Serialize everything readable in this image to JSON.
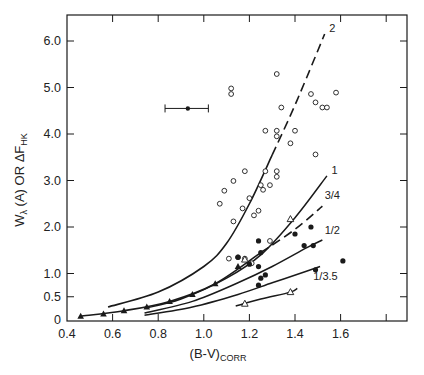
{
  "chart_data": {
    "type": "scatter",
    "title": "",
    "xlabel": "(B-V)CORR",
    "xlabel_main": "(B-V)",
    "xlabel_sub": "CORR",
    "ylabel": "Wλ (A) OR ΔF_HK",
    "ylabel_parts": {
      "w": "W",
      "lambda_sub": "λ",
      "a": " (A)  OR  ",
      "delta_f": "ΔF",
      "hk_sub": "HK"
    },
    "xlim": [
      0.4,
      1.9
    ],
    "ylim": [
      0,
      6.5
    ],
    "grid": false,
    "legend": "none (curves labeled inline)",
    "x_ticks": [
      0.4,
      0.6,
      0.8,
      1.0,
      1.2,
      1.4,
      1.6,
      1.8
    ],
    "x_tick_labels": [
      "0.4",
      "0.6",
      "0.8",
      "1.0",
      "1.2",
      "1.4",
      "1.6",
      ""
    ],
    "y_ticks": [
      0,
      0.5,
      1.0,
      2.0,
      3.0,
      4.0,
      5.0,
      6.0
    ],
    "y_tick_labels": [
      "0",
      "0.5",
      "1.0",
      "2.0",
      "3.0",
      "4.0",
      "5.0",
      "6.0"
    ],
    "series": [
      {
        "name": "open circles",
        "marker": "open-circle",
        "points": [
          [
            1.32,
            5.29
          ],
          [
            1.12,
            4.98
          ],
          [
            1.12,
            4.86
          ],
          [
            1.58,
            4.89
          ],
          [
            1.47,
            4.86
          ],
          [
            1.49,
            4.68
          ],
          [
            1.52,
            4.57
          ],
          [
            1.54,
            4.57
          ],
          [
            1.34,
            4.57
          ],
          [
            1.27,
            4.07
          ],
          [
            1.32,
            4.07
          ],
          [
            1.32,
            3.95
          ],
          [
            1.4,
            4.07
          ],
          [
            1.38,
            3.8
          ],
          [
            1.49,
            3.56
          ],
          [
            1.18,
            3.2
          ],
          [
            1.27,
            3.2
          ],
          [
            1.32,
            3.2
          ],
          [
            1.32,
            3.08
          ],
          [
            1.29,
            2.9
          ],
          [
            1.25,
            2.9
          ],
          [
            1.26,
            2.8
          ],
          [
            1.13,
            2.99
          ],
          [
            1.2,
            2.62
          ],
          [
            1.17,
            2.4
          ],
          [
            1.24,
            2.35
          ],
          [
            1.07,
            2.5
          ],
          [
            1.13,
            2.12
          ],
          [
            1.09,
            2.78
          ],
          [
            1.22,
            2.25
          ],
          [
            1.29,
            1.7
          ],
          [
            1.11,
            1.32
          ],
          [
            1.15,
            1.35
          ],
          [
            1.21,
            1.22
          ],
          [
            1.18,
            1.32
          ]
        ]
      },
      {
        "name": "filled circles",
        "marker": "filled-circle",
        "points": [
          [
            1.24,
            1.7
          ],
          [
            1.4,
            1.85
          ],
          [
            1.47,
            2.0
          ],
          [
            1.44,
            1.6
          ],
          [
            1.48,
            1.6
          ],
          [
            1.61,
            1.27
          ],
          [
            1.49,
            1.08
          ],
          [
            1.15,
            1.35
          ],
          [
            1.25,
            1.45
          ],
          [
            1.24,
            1.15
          ],
          [
            1.25,
            0.9
          ],
          [
            1.27,
            0.97
          ],
          [
            1.24,
            0.75
          ],
          [
            1.2,
            1.2
          ]
        ]
      },
      {
        "name": "filled triangles",
        "marker": "filled-triangle",
        "points": [
          [
            0.46,
            0.08
          ],
          [
            0.56,
            0.13
          ],
          [
            0.65,
            0.2
          ],
          [
            0.75,
            0.28
          ],
          [
            0.85,
            0.4
          ],
          [
            0.95,
            0.55
          ],
          [
            1.05,
            0.78
          ],
          [
            1.15,
            1.15
          ]
        ]
      },
      {
        "name": "open triangles",
        "marker": "open-triangle",
        "points": [
          [
            1.38,
            2.17
          ],
          [
            1.18,
            1.3
          ],
          [
            1.38,
            0.6
          ],
          [
            1.18,
            0.35
          ]
        ]
      },
      {
        "name": "error bar point",
        "marker": "filled-dot-with-xerr",
        "points": [
          [
            0.93,
            4.55
          ]
        ],
        "xerr": [
          0.83,
          1.02
        ]
      }
    ],
    "curves": [
      {
        "label": "2",
        "style": "solid-then-dashed",
        "points": [
          [
            0.58,
            0.28
          ],
          [
            0.8,
            0.6
          ],
          [
            1.0,
            1.15
          ],
          [
            1.1,
            1.65
          ],
          [
            1.2,
            2.5
          ],
          [
            1.3,
            3.55
          ],
          [
            1.38,
            4.4
          ],
          [
            1.45,
            5.2
          ],
          [
            1.53,
            6.15
          ]
        ]
      },
      {
        "label": "1",
        "style": "solid",
        "points": [
          [
            0.74,
            0.25
          ],
          [
            0.9,
            0.45
          ],
          [
            1.1,
            0.9
          ],
          [
            1.25,
            1.4
          ],
          [
            1.4,
            2.2
          ],
          [
            1.54,
            3.1
          ]
        ]
      },
      {
        "label": "3/4",
        "style": "solid-then-dashed",
        "points": [
          [
            0.46,
            0.08
          ],
          [
            0.65,
            0.2
          ],
          [
            0.85,
            0.4
          ],
          [
            1.05,
            0.78
          ],
          [
            1.25,
            1.45
          ],
          [
            1.4,
            1.95
          ],
          [
            1.52,
            2.45
          ]
        ]
      },
      {
        "label": "1/2",
        "style": "solid",
        "points": [
          [
            0.74,
            0.15
          ],
          [
            0.95,
            0.4
          ],
          [
            1.15,
            0.8
          ],
          [
            1.3,
            1.15
          ],
          [
            1.45,
            1.55
          ],
          [
            1.52,
            1.72
          ]
        ]
      },
      {
        "label": "1/3.5",
        "style": "solid",
        "points": [
          [
            0.74,
            0.1
          ],
          [
            0.95,
            0.28
          ],
          [
            1.15,
            0.55
          ],
          [
            1.3,
            0.8
          ],
          [
            1.45,
            1.05
          ],
          [
            1.51,
            1.15
          ]
        ]
      },
      {
        "label": "",
        "style": "solid",
        "points": [
          [
            1.14,
            0.3
          ],
          [
            1.25,
            0.45
          ],
          [
            1.38,
            0.6
          ],
          [
            1.41,
            0.68
          ]
        ]
      }
    ],
    "annotations": [
      {
        "text": "2",
        "at": [
          1.55,
          6.2
        ]
      },
      {
        "text": "1",
        "at": [
          1.56,
          3.15
        ]
      },
      {
        "text": "3/4",
        "at": [
          1.53,
          2.6
        ]
      },
      {
        "text": "1/2",
        "at": [
          1.53,
          1.85
        ]
      },
      {
        "text": "1/3.5",
        "at": [
          1.48,
          0.85
        ]
      }
    ]
  }
}
